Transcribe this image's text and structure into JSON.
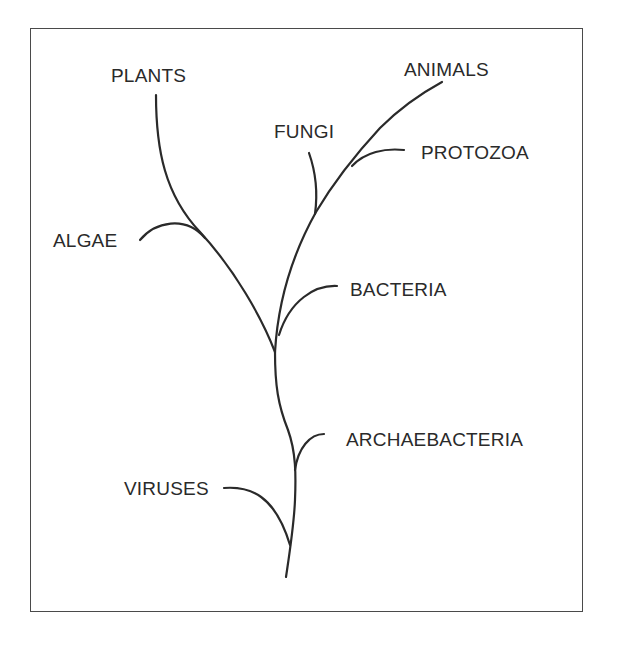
{
  "diagram": {
    "title": "",
    "type": "phylogenetic-tree",
    "stroke_color": "#2a2a2a",
    "border_color": "#4a4a4a",
    "labels": {
      "plants": "PLANTS",
      "animals": "ANIMALS",
      "fungi": "FUNGI",
      "protozoa": "PROTOZOA",
      "algae": "ALGAE",
      "bacteria": "BACTERIA",
      "archaebacteria": "ARCHAEBACTERIA",
      "viruses": "VIRUSES"
    },
    "branches": [
      {
        "name": "plants",
        "joins": "left-branch"
      },
      {
        "name": "algae",
        "joins": "left-branch"
      },
      {
        "name": "animals",
        "joins": "right-branch"
      },
      {
        "name": "protozoa",
        "joins": "animals"
      },
      {
        "name": "fungi",
        "joins": "right-branch"
      },
      {
        "name": "bacteria",
        "joins": "right-branch"
      },
      {
        "name": "archaebacteria",
        "joins": "trunk"
      },
      {
        "name": "viruses",
        "joins": "trunk"
      }
    ]
  }
}
